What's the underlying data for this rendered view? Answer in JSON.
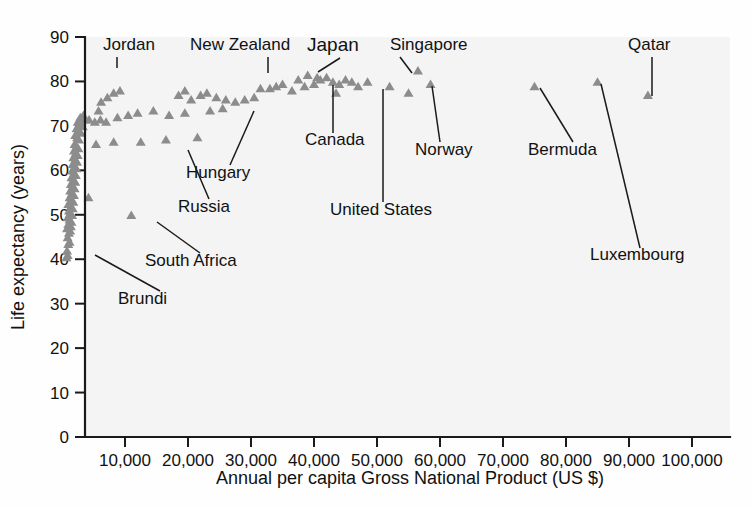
{
  "chart_data": {
    "type": "scatter",
    "title": "",
    "xlabel": "Annual per capita Gross National Product (US $)",
    "ylabel": "Life expectancy (years)",
    "xlim": [
      0,
      105000
    ],
    "ylim": [
      0,
      90
    ],
    "xticks": [
      10000,
      20000,
      30000,
      40000,
      50000,
      60000,
      70000,
      80000,
      90000,
      100000
    ],
    "xticklabels": [
      "10,000",
      "20,000",
      "30,000",
      "40,000",
      "50,000",
      "60,000",
      "70,000",
      "80,000",
      "90,000",
      "100,000"
    ],
    "yticks": [
      0,
      10,
      20,
      30,
      40,
      50,
      60,
      70,
      80,
      90
    ],
    "yticklabels": [
      "0",
      "10",
      "20",
      "30",
      "40",
      "50",
      "60",
      "70",
      "80",
      "90"
    ],
    "grid": false,
    "legend": false,
    "marker": "triangle",
    "marker_color": "#8c8c8c",
    "points": [
      [
        700,
        40.5
      ],
      [
        900,
        41.0
      ],
      [
        800,
        42.0
      ],
      [
        1000,
        43.5
      ],
      [
        1200,
        44.0
      ],
      [
        900,
        45.0
      ],
      [
        1100,
        46.0
      ],
      [
        1300,
        46.5
      ],
      [
        800,
        47.0
      ],
      [
        1400,
        47.5
      ],
      [
        1000,
        48.0
      ],
      [
        1500,
        48.5
      ],
      [
        1200,
        49.0
      ],
      [
        900,
        49.5
      ],
      [
        1600,
        50.0
      ],
      [
        1300,
        50.5
      ],
      [
        1100,
        51.0
      ],
      [
        1700,
        51.5
      ],
      [
        1400,
        52.0
      ],
      [
        1000,
        52.5
      ],
      [
        1800,
        53.0
      ],
      [
        1500,
        53.5
      ],
      [
        1200,
        54.0
      ],
      [
        4200,
        54.0
      ],
      [
        1900,
        54.5
      ],
      [
        1600,
        55.0
      ],
      [
        1300,
        55.5
      ],
      [
        2000,
        56.0
      ],
      [
        1700,
        56.5
      ],
      [
        1400,
        57.0
      ],
      [
        2100,
        57.5
      ],
      [
        1800,
        58.0
      ],
      [
        1500,
        58.5
      ],
      [
        2200,
        59.0
      ],
      [
        1900,
        59.5
      ],
      [
        1600,
        60.0
      ],
      [
        2300,
        60.5
      ],
      [
        2000,
        61.0
      ],
      [
        1700,
        61.5
      ],
      [
        2400,
        62.0
      ],
      [
        2100,
        62.5
      ],
      [
        1800,
        63.0
      ],
      [
        2500,
        63.5
      ],
      [
        2200,
        64.0
      ],
      [
        1900,
        64.5
      ],
      [
        2600,
        65.0
      ],
      [
        2300,
        65.5
      ],
      [
        2000,
        66.0
      ],
      [
        5400,
        66.0
      ],
      [
        8200,
        66.5
      ],
      [
        12500,
        66.5
      ],
      [
        16500,
        67.0
      ],
      [
        21500,
        67.5
      ],
      [
        2700,
        67.0
      ],
      [
        2400,
        67.5
      ],
      [
        2100,
        68.0
      ],
      [
        3000,
        68.5
      ],
      [
        2600,
        69.0
      ],
      [
        2300,
        69.5
      ],
      [
        3300,
        70.0
      ],
      [
        2800,
        70.5
      ],
      [
        2500,
        71.0
      ],
      [
        3600,
        71.5
      ],
      [
        3100,
        71.0
      ],
      [
        4300,
        71.5
      ],
      [
        5200,
        71.0
      ],
      [
        6100,
        71.5
      ],
      [
        7000,
        71.0
      ],
      [
        2900,
        72.0
      ],
      [
        3400,
        72.5
      ],
      [
        8800,
        72.0
      ],
      [
        10500,
        72.5
      ],
      [
        12000,
        73.0
      ],
      [
        14500,
        73.5
      ],
      [
        19500,
        73.0
      ],
      [
        23500,
        73.5
      ],
      [
        17000,
        72.5
      ],
      [
        25500,
        74.0
      ],
      [
        27500,
        75.5
      ],
      [
        26000,
        76.0
      ],
      [
        6200,
        75.5
      ],
      [
        7200,
        76.5
      ],
      [
        8200,
        77.5
      ],
      [
        5800,
        73.5
      ],
      [
        20500,
        76.0
      ],
      [
        22000,
        77.0
      ],
      [
        23000,
        77.5
      ],
      [
        24500,
        76.5
      ],
      [
        18500,
        77.0
      ],
      [
        19500,
        78.0
      ],
      [
        29000,
        76.0
      ],
      [
        30500,
        76.5
      ],
      [
        31500,
        78.5
      ],
      [
        33000,
        78.5
      ],
      [
        35000,
        79.5
      ],
      [
        36500,
        78.0
      ],
      [
        38500,
        79.0
      ],
      [
        40000,
        79.5
      ],
      [
        41000,
        80.5
      ],
      [
        42000,
        81.0
      ],
      [
        43000,
        80.0
      ],
      [
        44000,
        79.5
      ],
      [
        45000,
        80.5
      ],
      [
        46000,
        80.0
      ],
      [
        47000,
        79.0
      ],
      [
        43500,
        77.5
      ],
      [
        39000,
        81.5
      ],
      [
        40500,
        81.0
      ],
      [
        37500,
        80.5
      ],
      [
        34000,
        79.0
      ],
      [
        11000,
        50.0
      ],
      [
        9200,
        78.0
      ],
      [
        48500,
        80.0
      ],
      [
        52000,
        79.0
      ],
      [
        56500,
        82.5
      ],
      [
        58500,
        79.5
      ],
      [
        55000,
        77.5
      ],
      [
        75000,
        79.0
      ],
      [
        85000,
        80.0
      ],
      [
        93000,
        77.0
      ]
    ],
    "annotations": [
      {
        "label": "Jordan",
        "x": 9200,
        "y": 78.0,
        "emphasis": false
      },
      {
        "label": "New Zealand",
        "x": 31500,
        "y": 78.5,
        "emphasis": false
      },
      {
        "label": "Japan",
        "x": 38500,
        "y": 81.5,
        "emphasis": true
      },
      {
        "label": "Singapore",
        "x": 56500,
        "y": 82.5,
        "emphasis": false
      },
      {
        "label": "Qatar",
        "x": 93000,
        "y": 77.0,
        "emphasis": false
      },
      {
        "label": "Canada",
        "x": 44000,
        "y": 80.0,
        "emphasis": false
      },
      {
        "label": "Norway",
        "x": 58500,
        "y": 79.5,
        "emphasis": false
      },
      {
        "label": "Bermuda",
        "x": 75000,
        "y": 79.0,
        "emphasis": false
      },
      {
        "label": "Hungary",
        "x": 25500,
        "y": 74.0,
        "emphasis": false
      },
      {
        "label": "United States",
        "x": 52000,
        "y": 79.0,
        "emphasis": false
      },
      {
        "label": "Russia",
        "x": 20500,
        "y": 66.0,
        "emphasis": false
      },
      {
        "label": "South Africa",
        "x": 11000,
        "y": 50.0,
        "emphasis": false
      },
      {
        "label": "Brundi",
        "x": 700,
        "y": 40.5,
        "emphasis": false
      },
      {
        "label": "Luxembourg",
        "x": 85000,
        "y": 80.0,
        "emphasis": false
      }
    ]
  },
  "chart": {
    "xlabel": "Annual per capita Gross National Product (US $)",
    "ylabel": "Life expectancy (years)"
  }
}
